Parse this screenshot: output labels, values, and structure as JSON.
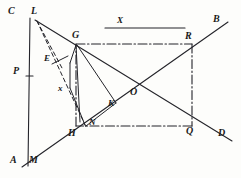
{
  "figure": {
    "stroke_color": "#24242a",
    "background_color": "#fdfdfb"
  },
  "labels": [
    {
      "id": "C",
      "text": "C",
      "x": 8,
      "y": 6,
      "size": 10
    },
    {
      "id": "L",
      "text": "L",
      "x": 31,
      "y": 6,
      "size": 10
    },
    {
      "id": "B",
      "text": "B",
      "x": 213,
      "y": 14,
      "size": 10
    },
    {
      "id": "X_top",
      "text": "X",
      "x": 117,
      "y": 16,
      "size": 9
    },
    {
      "id": "G",
      "text": "G",
      "x": 72,
      "y": 30,
      "size": 10
    },
    {
      "id": "R",
      "text": "R",
      "x": 185,
      "y": 31,
      "size": 10
    },
    {
      "id": "E",
      "text": "E",
      "x": 44,
      "y": 54,
      "size": 9
    },
    {
      "id": "P",
      "text": "P",
      "x": 13,
      "y": 66,
      "size": 10
    },
    {
      "id": "x_small",
      "text": "x",
      "x": 58,
      "y": 84,
      "size": 9
    },
    {
      "id": "O",
      "text": "O",
      "x": 130,
      "y": 87,
      "size": 10
    },
    {
      "id": "K",
      "text": "K",
      "x": 108,
      "y": 99,
      "size": 9
    },
    {
      "id": "N",
      "text": "N",
      "x": 89,
      "y": 118,
      "size": 9
    },
    {
      "id": "H",
      "text": "H",
      "x": 68,
      "y": 128,
      "size": 10
    },
    {
      "id": "Q",
      "text": "Q",
      "x": 186,
      "y": 126,
      "size": 10
    },
    {
      "id": "D",
      "text": "D",
      "x": 218,
      "y": 128,
      "size": 10
    },
    {
      "id": "A",
      "text": "A",
      "x": 10,
      "y": 155,
      "size": 10
    },
    {
      "id": "M",
      "text": "M",
      "x": 29,
      "y": 155,
      "size": 10
    }
  ],
  "points": {
    "C": {
      "x": 30,
      "y": 18
    },
    "L": {
      "x": 37,
      "y": 20
    },
    "B": {
      "x": 226,
      "y": 23
    },
    "G": {
      "x": 76,
      "y": 44
    },
    "R": {
      "x": 192,
      "y": 44
    },
    "E": {
      "x": 58,
      "y": 64
    },
    "P": {
      "x": 30,
      "y": 76
    },
    "O": {
      "x": 134,
      "y": 96
    },
    "K": {
      "x": 116,
      "y": 102
    },
    "N": {
      "x": 85,
      "y": 125
    },
    "H": {
      "x": 76,
      "y": 126
    },
    "Q": {
      "x": 192,
      "y": 126
    },
    "D": {
      "x": 230,
      "y": 140
    },
    "A": {
      "x": 26,
      "y": 163
    },
    "M": {
      "x": 41,
      "y": 158
    },
    "V1": {
      "x": 70,
      "y": 63
    },
    "V2": {
      "x": 70,
      "y": 88
    }
  },
  "segments": {
    "x_measure_bar": {
      "from": "x=105,y=28",
      "to": "x=185,y=28",
      "style": "solid"
    },
    "left_vertical_CA": {
      "from": "C",
      "to": "A",
      "style": "solid"
    },
    "ray_AMB": {
      "from": "A",
      "to": "B",
      "style": "solid"
    },
    "ray_LD": {
      "from": "L",
      "to": "D",
      "style": "solid"
    },
    "rect_top_GR": {
      "from": "G",
      "to": "R",
      "style": "dash-dot"
    },
    "rect_bottom_HQ": {
      "from": "H",
      "to": "Q",
      "style": "dash-dot"
    },
    "rect_left_GH": {
      "from": "G",
      "to": "H",
      "style": "dash-dot"
    },
    "rect_right_RQ": {
      "from": "R",
      "to": "Q",
      "style": "dash-dot"
    },
    "diag_LN": {
      "from": "L",
      "to": "N",
      "style": "dashed"
    },
    "seg_LE_x": {
      "from": "L",
      "to": "E",
      "style": "dashed"
    },
    "poly_G_V1": {
      "from": "G",
      "to": "V1",
      "style": "solid"
    },
    "poly_V1_V2": {
      "from": "V1",
      "to": "V2",
      "style": "solid"
    },
    "poly_V2_N": {
      "from": "V2",
      "to": "N",
      "style": "solid"
    },
    "poly_G_K": {
      "from": "G",
      "to": "K",
      "style": "solid"
    },
    "poly_K_N": {
      "from": "K",
      "to": "N",
      "style": "solid"
    }
  },
  "tick_marks": [
    {
      "id": "P-tick",
      "x": 30,
      "y": 76
    }
  ]
}
